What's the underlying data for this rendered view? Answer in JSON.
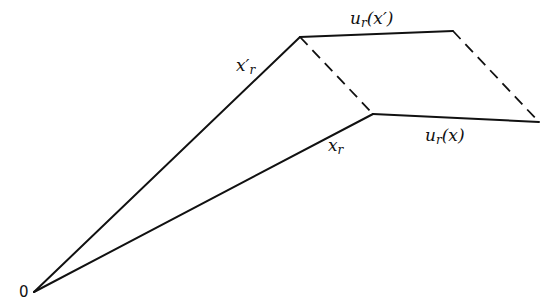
{
  "diagram": {
    "type": "vector-parallelogram",
    "origin": {
      "label": "0",
      "x": 34,
      "y": 292
    },
    "points": {
      "x_prime_r": {
        "x": 300,
        "y": 37
      },
      "x_r": {
        "x": 373,
        "y": 114
      },
      "x_prime_plus_u": {
        "x": 453,
        "y": 31
      },
      "x_plus_u": {
        "x": 539,
        "y": 122
      }
    },
    "labels": {
      "x_prime_r": {
        "base": "x′",
        "sub": "r"
      },
      "x_r": {
        "base": "x",
        "sub": "r"
      },
      "u_r_x_prime": {
        "base": "u",
        "sub": "r",
        "arg": "(x′)"
      },
      "u_r_x": {
        "base": "u",
        "sub": "r",
        "arg": "(x)"
      }
    },
    "edges": [
      {
        "from": "origin",
        "to": "x_prime_r",
        "style": "solid"
      },
      {
        "from": "origin",
        "to": "x_r",
        "style": "solid"
      },
      {
        "from": "x_prime_r",
        "to": "x_prime_plus_u",
        "style": "solid"
      },
      {
        "from": "x_r",
        "to": "x_plus_u",
        "style": "solid"
      },
      {
        "from": "x_prime_r",
        "to": "x_r",
        "style": "dashed"
      },
      {
        "from": "x_prime_plus_u",
        "to": "x_plus_u",
        "style": "dashed"
      }
    ]
  }
}
